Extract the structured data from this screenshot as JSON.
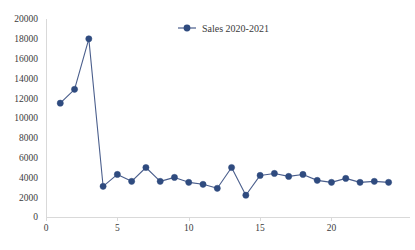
{
  "chart_data": {
    "type": "line",
    "title": "",
    "subtitle": "",
    "xlabel": "",
    "ylabel": "",
    "xlim": [
      0,
      25.5
    ],
    "ylim": [
      0,
      20000
    ],
    "grid": false,
    "legend_position": "top-center",
    "y_ticks": [
      0,
      2000,
      4000,
      6000,
      8000,
      10000,
      12000,
      14000,
      16000,
      18000,
      20000
    ],
    "y_tick_labels": [
      "0",
      "2000",
      "4000",
      "6000",
      "8000",
      "10000",
      "12000",
      "14000",
      "16000",
      "18000",
      "20000"
    ],
    "x_ticks": [
      0,
      5,
      10,
      15,
      20
    ],
    "x_tick_labels": [
      "0",
      "5",
      "10",
      "15",
      "20"
    ],
    "series": [
      {
        "name": "Sales 2020-2021",
        "color": "#4a5e8c",
        "marker_color": "#2f4b7f",
        "marker": "circle",
        "x": [
          1,
          2,
          3,
          4,
          5,
          6,
          7,
          8,
          9,
          10,
          11,
          12,
          13,
          14,
          15,
          16,
          17,
          18,
          19,
          20,
          21,
          22,
          23,
          24
        ],
        "values": [
          11500,
          12900,
          18000,
          3100,
          4300,
          3600,
          5000,
          3600,
          4000,
          3500,
          3300,
          2900,
          5000,
          2200,
          4200,
          4400,
          4100,
          4300,
          3700,
          3500,
          3900,
          3500,
          3600,
          3500
        ]
      }
    ]
  },
  "legend": {
    "entries": [
      {
        "label": "Sales 2020-2021"
      }
    ]
  },
  "colors": {
    "series_line": "#4a5e8c",
    "series_marker": "#2f4b7f",
    "axis": "#d9d9d9",
    "text": "#3b3b3b",
    "background": "#ffffff"
  }
}
